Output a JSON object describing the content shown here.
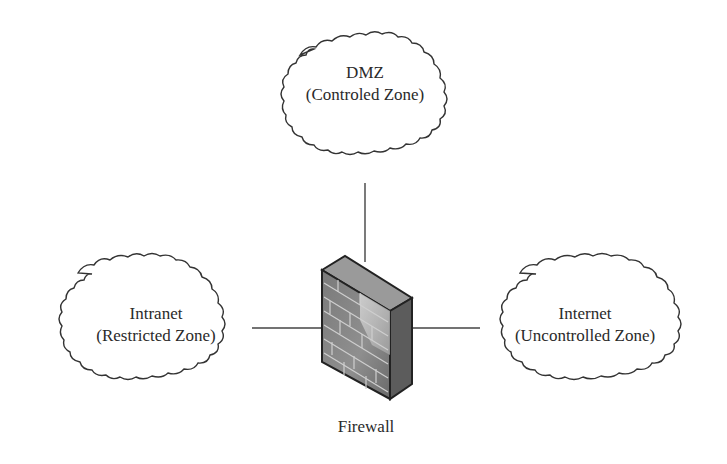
{
  "zones": {
    "dmz": {
      "title": "DMZ",
      "subtitle": "(Controled Zone)"
    },
    "intranet": {
      "title": "Intranet",
      "subtitle": "(Restricted Zone)"
    },
    "internet": {
      "title": "Internet",
      "subtitle": "(Uncontrolled Zone)"
    }
  },
  "firewall": {
    "label": "Firewall",
    "icon": "brick-firewall-icon"
  },
  "connections": [
    {
      "from": "dmz",
      "to": "firewall"
    },
    {
      "from": "intranet",
      "to": "firewall"
    },
    {
      "from": "firewall",
      "to": "internet"
    }
  ],
  "colors": {
    "stroke": "#333333",
    "cloud_fill": "#ffffff",
    "brick_dark": "#6e6e6e",
    "brick_light": "#a8a8a8",
    "mortar": "#cfcfcf"
  }
}
